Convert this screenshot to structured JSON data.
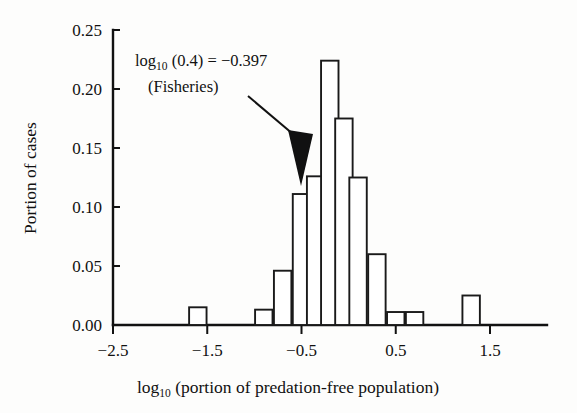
{
  "figure": {
    "background_color": "#fdfdfc",
    "ink_color": "#111111"
  },
  "annotation": {
    "line1_prefix": "log",
    "line1_sub": "10",
    "line1_rest": " (0.4) = −0.397",
    "line2": "(Fisheries)",
    "arrow_name": "annotation-arrow"
  },
  "axes": {
    "x_title_prefix": "log",
    "x_title_sub": "10",
    "x_title_rest": " (portion of predation-free population)",
    "y_title": "Portion of cases"
  },
  "chart_data": {
    "type": "bar",
    "title": "",
    "subtitle": "",
    "xlabel": "log10 (portion of predation-free population)",
    "ylabel": "Portion of cases",
    "xlim": [
      -2.8,
      1.9
    ],
    "ylim": [
      0.0,
      0.25
    ],
    "grid": false,
    "legend": "none",
    "x_ticks": [
      -2.5,
      -1.5,
      -0.5,
      0.5,
      1.5
    ],
    "x_tick_labels": [
      "−2.5",
      "−1.5",
      "−0.5",
      "0.5",
      "1.5"
    ],
    "y_ticks": [
      0.0,
      0.05,
      0.1,
      0.15,
      0.2,
      0.25
    ],
    "y_tick_labels": [
      "0.00",
      "0.05",
      "0.10",
      "0.15",
      "0.20",
      "0.25"
    ],
    "bar_width": 0.185,
    "bin_centers": [
      -1.6,
      -0.9,
      -0.7,
      -0.5,
      -0.35,
      -0.2,
      -0.05,
      0.1,
      0.3,
      0.5,
      0.7,
      1.3
    ],
    "values": [
      0.015,
      0.013,
      0.046,
      0.111,
      0.126,
      0.224,
      0.175,
      0.125,
      0.06,
      0.011,
      0.011,
      0.025
    ],
    "annotations": [
      {
        "text": "log10 (0.4) = −0.397 (Fisheries)",
        "points_to_x": -0.35,
        "points_to_y": 0.126
      }
    ]
  }
}
